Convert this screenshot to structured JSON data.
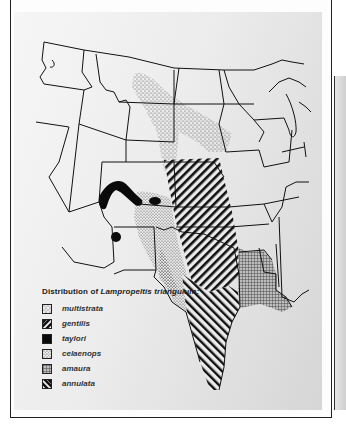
{
  "figure": {
    "title_prefix": "Distribution of ",
    "title_species": "Lampropeltis triangulum:",
    "region": "Western and central United States"
  },
  "legend": {
    "items": [
      {
        "label": "multistrata",
        "pattern": "sparse-stipple",
        "swatch_name": "multistrata-swatch"
      },
      {
        "label": "gentilis",
        "pattern": "wide-diagonal-hatch",
        "swatch_name": "gentilis-swatch"
      },
      {
        "label": "taylori",
        "pattern": "solid-black",
        "swatch_name": "taylori-swatch"
      },
      {
        "label": "celaenops",
        "pattern": "fine-stipple",
        "swatch_name": "celaenops-swatch"
      },
      {
        "label": "amaura",
        "pattern": "cross-grid",
        "swatch_name": "amaura-swatch"
      },
      {
        "label": "annulata",
        "pattern": "reverse-diagonal-hatch",
        "swatch_name": "annulata-swatch"
      }
    ]
  },
  "colors": {
    "ink": "#111111",
    "panel_light": "#f6f6f6",
    "panel_dark": "#d6d6d6",
    "stipple": "#555555"
  }
}
